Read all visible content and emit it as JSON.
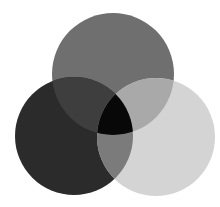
{
  "diagram": {
    "type": "venn",
    "sets": [
      {
        "id": "top",
        "cx": 113,
        "cy": 74,
        "r": 61,
        "color": "#6f6f6f"
      },
      {
        "id": "left",
        "cx": 74,
        "cy": 136,
        "r": 59,
        "color": "#2b2b2b"
      },
      {
        "id": "right",
        "cx": 156,
        "cy": 137,
        "r": 59,
        "color": "#d4d4d4"
      }
    ],
    "overlaps": {
      "top_left": "#3e3e3e",
      "top_right": "#a9a9a9",
      "left_right": "#7b7b7b",
      "all": "#080808"
    },
    "background": "#ffffff"
  }
}
